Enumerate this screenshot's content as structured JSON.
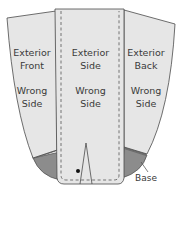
{
  "diagram": {
    "panels": [
      {
        "id": "front",
        "line1": "Exterior",
        "line2": "Front",
        "line3": "Wrong",
        "line4": "Side"
      },
      {
        "id": "side",
        "line1": "Exterior",
        "line2": "Side",
        "line3": "Wrong",
        "line4": "Side"
      },
      {
        "id": "back",
        "line1": "Exterior",
        "line2": "Back",
        "line3": "Wrong",
        "line4": "Side"
      }
    ],
    "base_label": "Base",
    "colors": {
      "panel_fill": "#e6e6e6",
      "outline": "#4a4a4a",
      "base_fill": "#8c8c8c",
      "base_band": "#6e6e6e",
      "stitch": "#555555"
    }
  }
}
